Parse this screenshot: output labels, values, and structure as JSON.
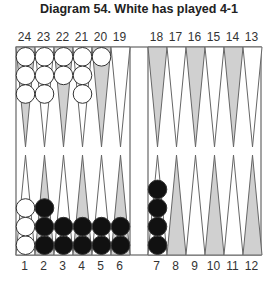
{
  "title": "Diagram 54. White has played 4-1",
  "top_labels": [
    "24",
    "23",
    "22",
    "21",
    "20",
    "19",
    "18",
    "17",
    "16",
    "15",
    "14",
    "13"
  ],
  "bottom_labels": [
    "1",
    "2",
    "3",
    "4",
    "5",
    "6",
    "7",
    "8",
    "9",
    "10",
    "11",
    "12"
  ],
  "colors": {
    "shade": "#d0d0d0",
    "line": "#666666",
    "white_checker": "#ffffff",
    "black_checker": "#111111"
  },
  "position": {
    "24": {
      "color": "white",
      "count": 3
    },
    "23": {
      "color": "white",
      "count": 3
    },
    "22": {
      "color": "white",
      "count": 2
    },
    "21": {
      "color": "white",
      "count": 3
    },
    "20": {
      "color": "white",
      "count": 1
    },
    "1": {
      "color": "white",
      "count": 3
    },
    "2": {
      "color": "black",
      "count": 3
    },
    "3": {
      "color": "black",
      "count": 2
    },
    "4": {
      "color": "black",
      "count": 2
    },
    "5": {
      "color": "black",
      "count": 2
    },
    "6": {
      "color": "black",
      "count": 2
    },
    "7": {
      "color": "black",
      "count": 4
    }
  }
}
